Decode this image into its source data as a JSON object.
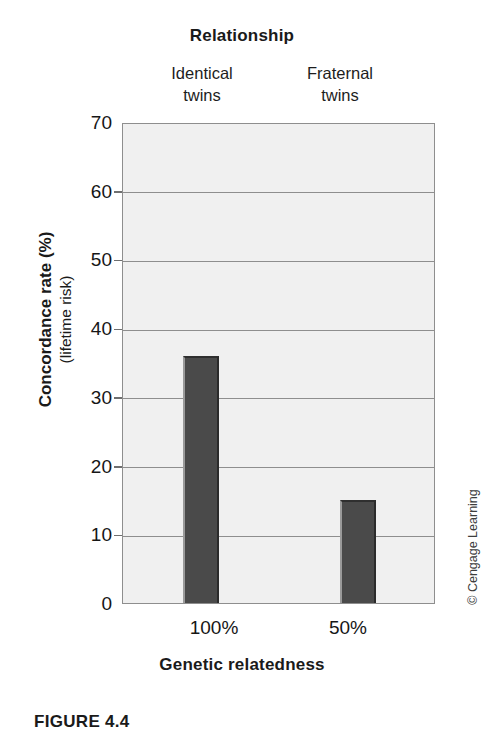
{
  "chart_data": {
    "type": "bar",
    "title": "Relationship",
    "xlabel": "Genetic relatedness",
    "ylabel": "Concordance rate (%)",
    "ylabel_sub": "(lifetime risk)",
    "categories": [
      "100%",
      "50%"
    ],
    "group_labels": [
      {
        "line1": "Identical",
        "line2": "twins"
      },
      {
        "line1": "Fraternal",
        "line2": "twins"
      }
    ],
    "values": [
      36,
      15
    ],
    "ylim": [
      0,
      70
    ],
    "yticks": [
      70,
      60,
      50,
      40,
      30,
      20,
      10,
      0
    ],
    "grid": true,
    "legend": "none",
    "bar_color": "#4a4a4a",
    "plot_bg_color": "#f0f0f0",
    "gridline_color": "#8e8e8e"
  },
  "credit": {
    "text": "© Cengage Learning"
  },
  "caption": {
    "text": "FIGURE 4.4"
  }
}
